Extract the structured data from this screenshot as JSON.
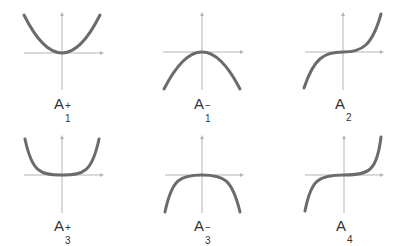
{
  "colors": {
    "axis": "#b5b5b5",
    "curve": "#6b6b6b",
    "label": "#333333",
    "background": "#ffffff"
  },
  "panels": [
    {
      "id": "A1plus",
      "label": {
        "base": "A",
        "sub": "1",
        "sup": "+"
      },
      "curve": "y = x^2 (upward parabola)"
    },
    {
      "id": "A1minus",
      "label": {
        "base": "A",
        "sub": "1",
        "sup": "−"
      },
      "curve": "y = -x^2 (downward parabola)"
    },
    {
      "id": "A2",
      "label": {
        "base": "A",
        "sub": "2",
        "sup": ""
      },
      "curve": "y = x^3 (cubic)"
    },
    {
      "id": "A3plus",
      "label": {
        "base": "A",
        "sub": "3",
        "sup": "+"
      },
      "curve": "y = x^4 (flat-bottomed quartic)"
    },
    {
      "id": "A3minus",
      "label": {
        "base": "A",
        "sub": "3",
        "sup": "−"
      },
      "curve": "y = -x^4 (flat-topped quartic)"
    },
    {
      "id": "A4",
      "label": {
        "base": "A",
        "sub": "4",
        "sup": ""
      },
      "curve": "y = x^5 (quintic)"
    }
  ]
}
